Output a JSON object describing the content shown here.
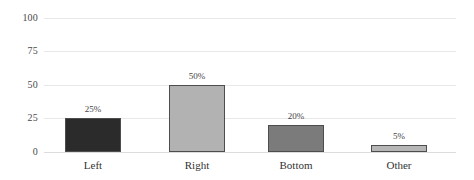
{
  "chart_data": {
    "type": "bar",
    "title": "",
    "subtitle": "",
    "xlabel": "",
    "ylabel": "",
    "categories": [
      "Left",
      "Right",
      "Bottom",
      "Other"
    ],
    "values": [
      25,
      50,
      20,
      5
    ],
    "data_labels": [
      "25%",
      "50%",
      "20%",
      "5%"
    ],
    "series": [
      {
        "name": "",
        "values": [
          25,
          50,
          20,
          5
        ]
      }
    ],
    "ylim": [
      0,
      100
    ],
    "yticks": [
      0,
      25,
      50,
      75,
      100
    ],
    "ytick_labels": [
      "0",
      "25",
      "50",
      "75",
      "100"
    ],
    "grid": true,
    "grid_axis": "y",
    "legend": false,
    "legend_position": "none",
    "bar_colors": [
      "#2b2b2b",
      "#b2b2b2",
      "#7b7b7b",
      "#b6b6b6"
    ],
    "bar_border_color": "#4d4d4d",
    "gridline_color": "#e8e8e8",
    "background_color": "#ffffff",
    "text_color": "#3f3f3f"
  }
}
